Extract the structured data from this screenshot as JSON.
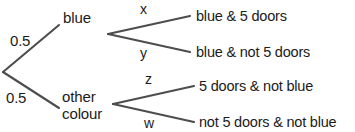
{
  "diagram": {
    "type": "probability-tree",
    "line_color": "#4d4d4d",
    "text_color": "#1b1b1b",
    "background_color": "#ffffff",
    "root": {
      "label": ""
    },
    "level1": {
      "branches": [
        {
          "probability": "0.5",
          "node_label": "blue"
        },
        {
          "probability": "0.5",
          "node_label_line1": "other",
          "node_label_line2": "colour"
        }
      ]
    },
    "level2": {
      "branches": [
        {
          "probability": "x",
          "outcome": "blue & 5 doors"
        },
        {
          "probability": "y",
          "outcome": "blue & not 5 doors"
        },
        {
          "probability": "z",
          "outcome": "5 doors & not blue"
        },
        {
          "probability": "w",
          "outcome": "not 5 doors & not blue"
        }
      ]
    }
  }
}
